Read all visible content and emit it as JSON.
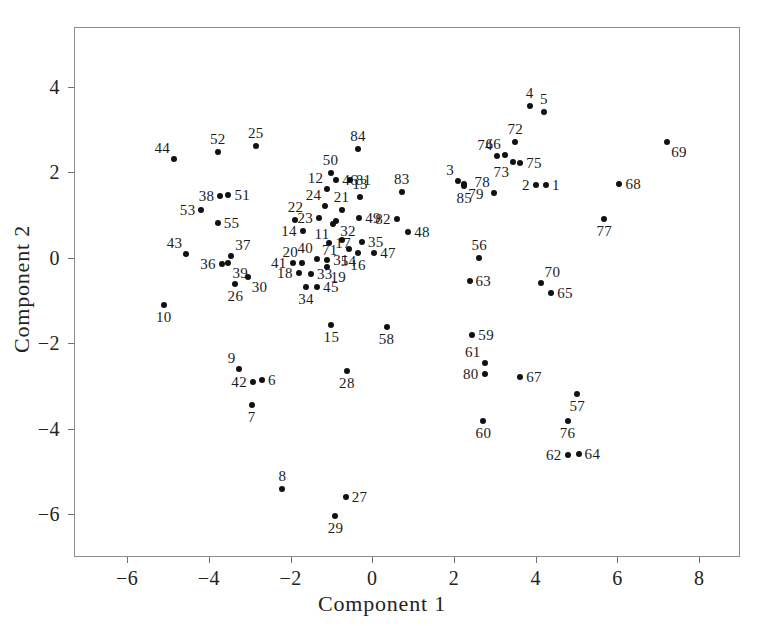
{
  "chart_data": {
    "type": "scatter",
    "title": "",
    "xlabel": "Component 1",
    "ylabel": "Component 2",
    "xlim": [
      -7.3,
      9.0
    ],
    "ylim": [
      -7.0,
      5.4
    ],
    "xticks": [
      -6,
      -4,
      -2,
      0,
      2,
      4,
      6,
      8
    ],
    "xticklabels": [
      "−6",
      "−4",
      "−2",
      "0",
      "2",
      "4",
      "6",
      "8"
    ],
    "yticks": [
      -6,
      -4,
      -2,
      0,
      2,
      4
    ],
    "yticklabels": [
      "−6",
      "−4",
      "−2",
      "0",
      "2",
      "4"
    ],
    "grid": false,
    "legend": null,
    "point_label_field": "label",
    "points": [
      {
        "label": "1",
        "x": 4.25,
        "y": 1.7,
        "lp": "e"
      },
      {
        "label": "2",
        "x": 4.0,
        "y": 1.7,
        "lp": "w"
      },
      {
        "label": "3",
        "x": 2.1,
        "y": 1.8,
        "lp": "nw"
      },
      {
        "label": "4",
        "x": 3.85,
        "y": 3.55,
        "lp": "n"
      },
      {
        "label": "5",
        "x": 4.2,
        "y": 3.4,
        "lp": "n"
      },
      {
        "label": "6",
        "x": -2.7,
        "y": -2.85,
        "lp": "e"
      },
      {
        "label": "7",
        "x": -2.95,
        "y": -3.45,
        "lp": "s"
      },
      {
        "label": "8",
        "x": -2.2,
        "y": -5.4,
        "lp": "n"
      },
      {
        "label": "9",
        "x": -3.25,
        "y": -2.6,
        "lp": "nw"
      },
      {
        "label": "10",
        "x": -5.1,
        "y": -1.1,
        "lp": "s"
      },
      {
        "label": "11",
        "x": -0.95,
        "y": 0.78,
        "lp": "sw"
      },
      {
        "label": "12",
        "x": -1.1,
        "y": 1.62,
        "lp": "nw"
      },
      {
        "label": "13",
        "x": -0.3,
        "y": 1.42,
        "lp": "n"
      },
      {
        "label": "14",
        "x": -1.7,
        "y": 0.62,
        "lp": "w"
      },
      {
        "label": "15",
        "x": -1.0,
        "y": -1.58,
        "lp": "s"
      },
      {
        "label": "16",
        "x": -0.35,
        "y": 0.12,
        "lp": "s"
      },
      {
        "label": "17",
        "x": -1.05,
        "y": 0.35,
        "lp": "e"
      },
      {
        "label": "18",
        "x": -1.8,
        "y": -0.35,
        "lp": "w"
      },
      {
        "label": "19",
        "x": -1.12,
        "y": -0.22,
        "lp": "se"
      },
      {
        "label": "20",
        "x": -1.72,
        "y": -0.12,
        "lp": "nw"
      },
      {
        "label": "21",
        "x": -0.75,
        "y": 1.12,
        "lp": "n"
      },
      {
        "label": "22",
        "x": -1.88,
        "y": 0.88,
        "lp": "n"
      },
      {
        "label": "23",
        "x": -1.3,
        "y": 0.92,
        "lp": "w"
      },
      {
        "label": "24",
        "x": -1.15,
        "y": 1.22,
        "lp": "nw"
      },
      {
        "label": "25",
        "x": -2.85,
        "y": 2.62,
        "lp": "n"
      },
      {
        "label": "26",
        "x": -3.35,
        "y": -0.62,
        "lp": "s"
      },
      {
        "label": "27",
        "x": -0.65,
        "y": -5.6,
        "lp": "e"
      },
      {
        "label": "28",
        "x": -0.62,
        "y": -2.65,
        "lp": "s"
      },
      {
        "label": "29",
        "x": -0.9,
        "y": -6.05,
        "lp": "s"
      },
      {
        "label": "30",
        "x": -3.05,
        "y": -0.45,
        "lp": "se"
      },
      {
        "label": "31",
        "x": -1.1,
        "y": -0.05,
        "lp": "e"
      },
      {
        "label": "32",
        "x": -0.88,
        "y": 0.85,
        "lp": "se"
      },
      {
        "label": "33",
        "x": -1.5,
        "y": -0.38,
        "lp": "e"
      },
      {
        "label": "34",
        "x": -1.62,
        "y": -0.68,
        "lp": "s"
      },
      {
        "label": "35",
        "x": -0.25,
        "y": 0.38,
        "lp": "e"
      },
      {
        "label": "36",
        "x": -3.68,
        "y": -0.15,
        "lp": "w"
      },
      {
        "label": "37",
        "x": -3.45,
        "y": 0.05,
        "lp": "ne"
      },
      {
        "label": "38",
        "x": -3.72,
        "y": 1.45,
        "lp": "w"
      },
      {
        "label": "39",
        "x": -3.52,
        "y": -0.12,
        "lp": "se"
      },
      {
        "label": "40",
        "x": -1.35,
        "y": -0.02,
        "lp": "nw"
      },
      {
        "label": "41",
        "x": -1.95,
        "y": -0.12,
        "lp": "w"
      },
      {
        "label": "42",
        "x": -2.92,
        "y": -2.9,
        "lp": "w"
      },
      {
        "label": "43",
        "x": -4.55,
        "y": 0.1,
        "lp": "nw"
      },
      {
        "label": "44",
        "x": -4.85,
        "y": 2.32,
        "lp": "nw"
      },
      {
        "label": "45",
        "x": -1.35,
        "y": -0.68,
        "lp": "e"
      },
      {
        "label": "46",
        "x": -0.88,
        "y": 1.82,
        "lp": "e"
      },
      {
        "label": "47",
        "x": 0.05,
        "y": 0.12,
        "lp": "e"
      },
      {
        "label": "48",
        "x": 0.88,
        "y": 0.6,
        "lp": "e"
      },
      {
        "label": "49",
        "x": -0.32,
        "y": 0.92,
        "lp": "e"
      },
      {
        "label": "50",
        "x": -1.02,
        "y": 1.98,
        "lp": "n"
      },
      {
        "label": "51",
        "x": -3.52,
        "y": 1.48,
        "lp": "e"
      },
      {
        "label": "52",
        "x": -3.78,
        "y": 2.48,
        "lp": "n"
      },
      {
        "label": "53",
        "x": -4.18,
        "y": 1.12,
        "lp": "w"
      },
      {
        "label": "54",
        "x": -0.58,
        "y": 0.2,
        "lp": "s"
      },
      {
        "label": "55",
        "x": -3.78,
        "y": 0.82,
        "lp": "e"
      },
      {
        "label": "56",
        "x": 2.62,
        "y": 0.0,
        "lp": "n"
      },
      {
        "label": "57",
        "x": 5.02,
        "y": -3.18,
        "lp": "s"
      },
      {
        "label": "58",
        "x": 0.35,
        "y": -1.62,
        "lp": "s"
      },
      {
        "label": "59",
        "x": 2.45,
        "y": -1.8,
        "lp": "e"
      },
      {
        "label": "60",
        "x": 2.72,
        "y": -3.82,
        "lp": "s"
      },
      {
        "label": "61",
        "x": 2.75,
        "y": -2.45,
        "lp": "nw"
      },
      {
        "label": "62",
        "x": 4.78,
        "y": -4.62,
        "lp": "w"
      },
      {
        "label": "63",
        "x": 2.38,
        "y": -0.55,
        "lp": "e"
      },
      {
        "label": "64",
        "x": 5.05,
        "y": -4.58,
        "lp": "e"
      },
      {
        "label": "65",
        "x": 4.38,
        "y": -0.82,
        "lp": "e"
      },
      {
        "label": "66",
        "x": 3.25,
        "y": 2.4,
        "lp": "nw"
      },
      {
        "label": "67",
        "x": 3.62,
        "y": -2.78,
        "lp": "e"
      },
      {
        "label": "68",
        "x": 6.05,
        "y": 1.72,
        "lp": "e"
      },
      {
        "label": "69",
        "x": 7.22,
        "y": 2.72,
        "lp": "se"
      },
      {
        "label": "70",
        "x": 4.12,
        "y": -0.58,
        "lp": "ne"
      },
      {
        "label": "71",
        "x": -0.75,
        "y": 0.42,
        "lp": "sw"
      },
      {
        "label": "72",
        "x": 3.5,
        "y": 2.72,
        "lp": "n"
      },
      {
        "label": "73",
        "x": 3.45,
        "y": 2.25,
        "lp": "sw"
      },
      {
        "label": "74",
        "x": 3.05,
        "y": 2.38,
        "lp": "nw"
      },
      {
        "label": "75",
        "x": 3.62,
        "y": 2.22,
        "lp": "e"
      },
      {
        "label": "76",
        "x": 4.78,
        "y": -3.82,
        "lp": "s"
      },
      {
        "label": "77",
        "x": 5.68,
        "y": 0.9,
        "lp": "s"
      },
      {
        "label": "78",
        "x": 2.98,
        "y": 1.52,
        "lp": "nw"
      },
      {
        "label": "79",
        "x": 2.25,
        "y": 1.72,
        "lp": "se"
      },
      {
        "label": "80",
        "x": 2.75,
        "y": -2.72,
        "lp": "w"
      },
      {
        "label": "81",
        "x": -0.55,
        "y": 1.82,
        "lp": "e"
      },
      {
        "label": "82",
        "x": 0.6,
        "y": 0.9,
        "lp": "w"
      },
      {
        "label": "83",
        "x": 0.72,
        "y": 1.55,
        "lp": "n"
      },
      {
        "label": "84",
        "x": -0.35,
        "y": 2.55,
        "lp": "n"
      },
      {
        "label": "85",
        "x": 2.25,
        "y": 1.68,
        "lp": "s"
      }
    ]
  },
  "axes": {
    "xlabel": "Component 1",
    "ylabel": "Component 2"
  }
}
